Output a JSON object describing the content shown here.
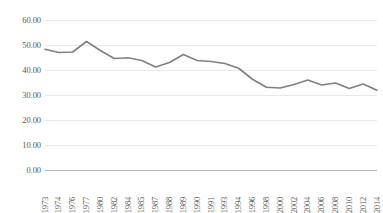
{
  "chart_data": {
    "type": "line",
    "title": "",
    "subtitle": "",
    "xlabel": "",
    "ylabel": "",
    "grid": true,
    "legend": false,
    "legend_position": "none",
    "line_color": "#808080",
    "gridline_color": "#e8e8e8",
    "axis_color": "#b8b8b8",
    "text_color": "#595959",
    "ylim": [
      0,
      60
    ],
    "ytick_step": 10,
    "ytick_labels": [
      "60.00",
      "50.00",
      "40.00",
      "30.00",
      "20.00",
      "10.00",
      "0.00"
    ],
    "ytick_values": [
      60,
      50,
      40,
      30,
      20,
      10,
      0
    ],
    "categories": [
      "1973",
      "1974",
      "1976",
      "1977",
      "1980",
      "1982",
      "1984",
      "1985",
      "1987",
      "1988",
      "1989",
      "1990",
      "1991",
      "1993",
      "1994",
      "1996",
      "1998",
      "2000",
      "2002",
      "2004",
      "2006",
      "2008",
      "2010",
      "2012",
      "2014"
    ],
    "values": [
      48.3,
      47.0,
      47.2,
      51.4,
      47.8,
      44.6,
      44.9,
      43.8,
      41.2,
      43.0,
      46.2,
      43.8,
      43.4,
      42.6,
      40.7,
      36.3,
      33.1,
      32.8,
      34.2,
      36.0,
      34.0,
      34.8,
      32.6,
      34.4,
      31.9
    ],
    "series": [
      {
        "name": "series-1",
        "values": [
          48.3,
          47.0,
          47.2,
          51.4,
          47.8,
          44.6,
          44.9,
          43.8,
          41.2,
          43.0,
          46.2,
          43.8,
          43.4,
          42.6,
          40.7,
          36.3,
          33.1,
          32.8,
          34.2,
          36.0,
          34.0,
          34.8,
          32.6,
          34.4,
          31.9
        ]
      }
    ],
    "annotations": []
  }
}
